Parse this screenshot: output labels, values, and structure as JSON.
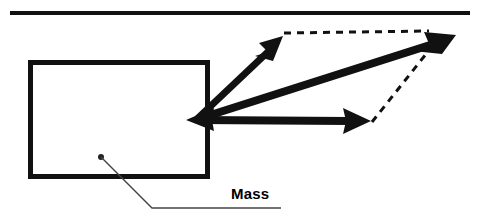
{
  "diagram": {
    "colors": {
      "stroke": "#111111",
      "background": "#ffffff",
      "leader": "#444444"
    },
    "labels": {
      "mass": "Mass"
    },
    "surface": {
      "name": "ceiling-line",
      "x1": 10,
      "y1": 13,
      "x2": 470,
      "y2": 13,
      "thickness": 4
    },
    "mass_box": {
      "name": "mass-box",
      "x": 28,
      "y": 60,
      "width": 180,
      "height": 118,
      "thickness": 5
    },
    "origin": {
      "x": 196,
      "y": 119
    },
    "vectors": [
      {
        "name": "force-vector-upper-left",
        "label": "",
        "x1": 196,
        "y1": 119,
        "x2": 281,
        "y2": 38,
        "style": "solid",
        "thickness": 7
      },
      {
        "name": "force-vector-horizontal",
        "label": "",
        "x1": 196,
        "y1": 119,
        "x2": 369,
        "y2": 121,
        "style": "solid",
        "thickness": 7
      },
      {
        "name": "resultant-vector",
        "label": "",
        "x1": 196,
        "y1": 119,
        "x2": 455,
        "y2": 36,
        "style": "solid",
        "thickness": 7
      },
      {
        "name": "reaction-arrowhead-into-mass",
        "label": "",
        "x1": 210,
        "y1": 119,
        "x2": 187,
        "y2": 120,
        "style": "solid",
        "thickness": 6
      }
    ],
    "construction_lines": [
      {
        "name": "parallelogram-dashed-top",
        "x1": 284,
        "y1": 33,
        "x2": 432,
        "y2": 31,
        "style": "dashed",
        "thickness": 3,
        "dash": "7 6"
      },
      {
        "name": "parallelogram-dashed-right",
        "x1": 372,
        "y1": 122,
        "x2": 436,
        "y2": 42,
        "style": "dashed",
        "thickness": 3,
        "dash": "7 6"
      }
    ],
    "leader": {
      "name": "mass-leader-line",
      "dot": {
        "x": 101,
        "y": 157,
        "r": 3
      },
      "points": "101,157 152,208 281,208",
      "thickness": 1.4
    }
  }
}
